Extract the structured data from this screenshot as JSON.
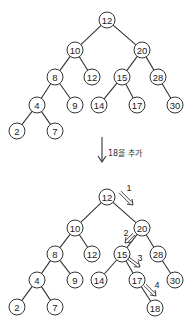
{
  "diagram": {
    "type": "binary-search-tree-insertion",
    "before": {
      "nodes": [
        {
          "id": "a",
          "value": "12"
        },
        {
          "id": "b",
          "value": "10"
        },
        {
          "id": "c",
          "value": "20"
        },
        {
          "id": "d",
          "value": "8"
        },
        {
          "id": "e",
          "value": "12"
        },
        {
          "id": "f",
          "value": "15"
        },
        {
          "id": "g",
          "value": "28"
        },
        {
          "id": "h",
          "value": "4"
        },
        {
          "id": "i",
          "value": "9"
        },
        {
          "id": "j",
          "value": "14"
        },
        {
          "id": "k",
          "value": "17"
        },
        {
          "id": "l",
          "value": "30"
        },
        {
          "id": "m",
          "value": "2"
        },
        {
          "id": "n",
          "value": "7"
        }
      ],
      "edges": [
        [
          "a",
          "b"
        ],
        [
          "a",
          "c"
        ],
        [
          "b",
          "d"
        ],
        [
          "b",
          "e"
        ],
        [
          "c",
          "f"
        ],
        [
          "c",
          "g"
        ],
        [
          "d",
          "h"
        ],
        [
          "d",
          "i"
        ],
        [
          "f",
          "j"
        ],
        [
          "f",
          "k"
        ],
        [
          "g",
          "l"
        ],
        [
          "h",
          "m"
        ],
        [
          "h",
          "n"
        ]
      ]
    },
    "transition": {
      "label": "18을 추가",
      "icon": "down-arrow-icon"
    },
    "after": {
      "nodes": [
        {
          "id": "a",
          "value": "12"
        },
        {
          "id": "b",
          "value": "10"
        },
        {
          "id": "c",
          "value": "20"
        },
        {
          "id": "d",
          "value": "8"
        },
        {
          "id": "e",
          "value": "12"
        },
        {
          "id": "f",
          "value": "15"
        },
        {
          "id": "g",
          "value": "28"
        },
        {
          "id": "h",
          "value": "4"
        },
        {
          "id": "i",
          "value": "9"
        },
        {
          "id": "j",
          "value": "14"
        },
        {
          "id": "k",
          "value": "17"
        },
        {
          "id": "l",
          "value": "30"
        },
        {
          "id": "m",
          "value": "2"
        },
        {
          "id": "n",
          "value": "7"
        },
        {
          "id": "o",
          "value": "18"
        }
      ],
      "edges": [
        [
          "a",
          "b"
        ],
        [
          "a",
          "c"
        ],
        [
          "b",
          "d"
        ],
        [
          "b",
          "e"
        ],
        [
          "c",
          "f"
        ],
        [
          "c",
          "g"
        ],
        [
          "d",
          "h"
        ],
        [
          "d",
          "i"
        ],
        [
          "f",
          "j"
        ],
        [
          "f",
          "k"
        ],
        [
          "g",
          "l"
        ],
        [
          "h",
          "m"
        ],
        [
          "h",
          "n"
        ],
        [
          "k",
          "o"
        ]
      ],
      "insertion_path": [
        {
          "step": "1",
          "from": "a",
          "to": "c"
        },
        {
          "step": "2",
          "from": "c",
          "to": "f"
        },
        {
          "step": "3",
          "from": "f",
          "to": "k"
        },
        {
          "step": "4",
          "from": "k",
          "to": "o"
        }
      ]
    }
  }
}
